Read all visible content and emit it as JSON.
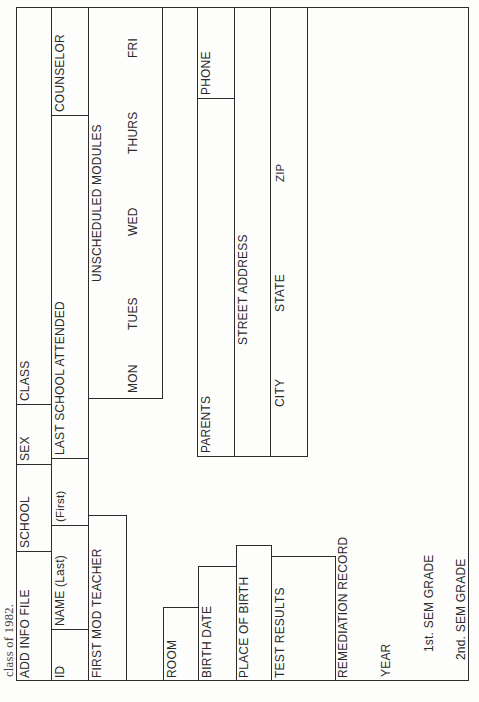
{
  "caption": "class of 1982.",
  "header_row": {
    "add_info_file": "ADD INFO FILE",
    "school": "SCHOOL",
    "sex": "SEX",
    "class": "CLASS"
  },
  "name_row": {
    "id": "ID",
    "name_last": "NAME (Last)",
    "name_first": "(First)",
    "last_school_attended": "LAST SCHOOL ATTENDED",
    "counselor": "COUNSELOR"
  },
  "module_row": {
    "first_mod_teacher": "FIRST MOD TEACHER",
    "unscheduled_modules": "UNSCHEDULED MODULES",
    "days": [
      "MON",
      "TUES",
      "WED",
      "THURS",
      "FRI"
    ]
  },
  "room_row": {
    "room": "ROOM"
  },
  "birth_row": {
    "birth_date": "BIRTH DATE",
    "parents": "PARENTS",
    "phone": "PHONE"
  },
  "address_row": {
    "place_of_birth": "PLACE OF BIRTH",
    "street_address": "STREET ADDRESS"
  },
  "test_row": {
    "test_results": "TEST RESULTS",
    "city": "CITY",
    "state": "STATE",
    "zip": "ZIP"
  },
  "remediation": {
    "remediation_record": "REMEDIATION RECORD",
    "year": "YEAR",
    "first_sem_grade": "1st. SEM GRADE",
    "second_sem_grade": "2nd. SEM GRADE"
  }
}
